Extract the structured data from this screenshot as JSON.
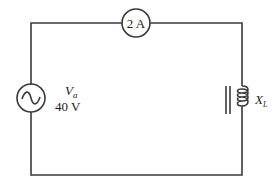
{
  "diagram": {
    "type": "series AC circuit",
    "ammeter": {
      "reading": "2 A"
    },
    "source": {
      "symbol": "V",
      "subscript": "a",
      "value": "40 V"
    },
    "inductor": {
      "symbol": "X",
      "subscript": "L"
    },
    "colors": {
      "wire": "#3a3a3a",
      "background": "#ffffff"
    }
  }
}
